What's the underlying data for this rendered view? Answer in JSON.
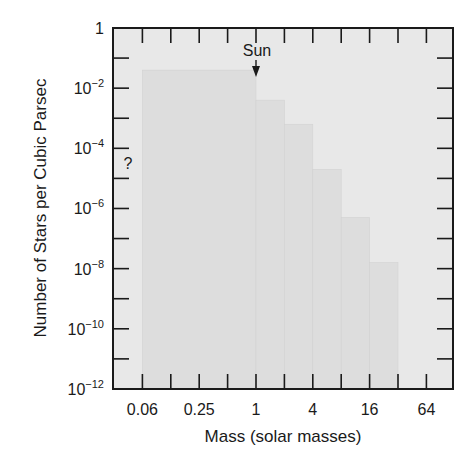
{
  "chart_data": {
    "type": "bar",
    "subtype": "histogram-step",
    "title": "",
    "xlabel": "Mass (solar masses)",
    "ylabel": "Number of Stars per Cubic Parsec",
    "x_scale": "log2",
    "y_scale": "log10",
    "xlim": [
      0.03,
      128
    ],
    "ylim": [
      1e-12,
      1
    ],
    "x_tick_labels": [
      "0.06",
      "0.25",
      "1",
      "4",
      "16",
      "64"
    ],
    "y_tick_labels": [
      {
        "base": "1",
        "exp": ""
      },
      {
        "base": "10",
        "exp": "−2"
      },
      {
        "base": "10",
        "exp": "−4"
      },
      {
        "base": "10",
        "exp": "−6"
      },
      {
        "base": "10",
        "exp": "−8"
      },
      {
        "base": "10",
        "exp": "−10"
      },
      {
        "base": "10",
        "exp": "−12"
      }
    ],
    "grid": false,
    "bins": [
      {
        "mass_from": 0.0625,
        "mass_to": 1,
        "log10_density": -1.4
      },
      {
        "mass_from": 1,
        "mass_to": 2,
        "log10_density": -2.4
      },
      {
        "mass_from": 2,
        "mass_to": 4,
        "log10_density": -3.2
      },
      {
        "mass_from": 4,
        "mass_to": 8,
        "log10_density": -4.7
      },
      {
        "mass_from": 8,
        "mass_to": 16,
        "log10_density": -6.3
      },
      {
        "mass_from": 16,
        "mass_to": 32,
        "log10_density": -7.8
      }
    ],
    "annotations": [
      {
        "text": "Sun",
        "at_mass": 1,
        "arrow": "down"
      },
      {
        "text": "?",
        "at_mass": 0.04,
        "near_log10": -4.5
      }
    ]
  },
  "colors": {
    "plot_bg": "#e8e8e8",
    "bar_fill": "#dddddd",
    "axis": "#1a1a1a"
  }
}
